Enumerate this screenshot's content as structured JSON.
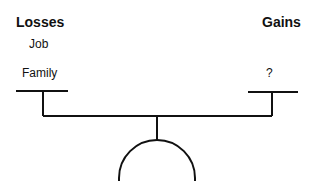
{
  "diagram": {
    "left_side": {
      "heading": "Losses",
      "items": [
        "Job",
        "Family"
      ]
    },
    "right_side": {
      "heading": "Gains",
      "items": [
        "?"
      ]
    },
    "line_color": "#111111"
  }
}
